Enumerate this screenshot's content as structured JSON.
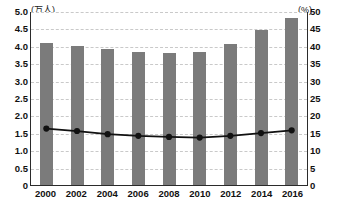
{
  "chart_data": {
    "type": "bar",
    "title": "",
    "subtitle": "",
    "xlabel": "",
    "ylabel": "(万人)",
    "y2label": "(%)",
    "grid": true,
    "legend": "none",
    "categories": [
      "2000",
      "2002",
      "2004",
      "2006",
      "2008",
      "2010",
      "2012",
      "2014",
      "2016"
    ],
    "ylim": [
      0,
      5.0
    ],
    "y2lim": [
      0,
      50
    ],
    "yticks": [
      "0",
      "0.5",
      "1.0",
      "1.5",
      "2.0",
      "2.5",
      "3.0",
      "3.5",
      "4.0",
      "4.5",
      "5.0"
    ],
    "ytick_values": [
      0,
      0.5,
      1.0,
      1.5,
      2.0,
      2.5,
      3.0,
      3.5,
      4.0,
      4.5,
      5.0
    ],
    "y2ticks": [
      "0",
      "5",
      "10",
      "15",
      "20",
      "25",
      "30",
      "35",
      "40",
      "45",
      "50"
    ],
    "y2tick_values": [
      0,
      5,
      10,
      15,
      20,
      25,
      30,
      35,
      40,
      45,
      50
    ],
    "series": [
      {
        "name": "人数",
        "type": "bar",
        "axis": "left",
        "unit": "万人",
        "color": "#7b7b7b",
        "values": [
          4.08,
          4.0,
          3.9,
          3.83,
          3.78,
          3.82,
          4.05,
          4.45,
          4.8
        ]
      },
      {
        "name": "割合",
        "type": "line",
        "axis": "right",
        "unit": "%",
        "color": "#111111",
        "values": [
          16.3,
          15.6,
          14.7,
          14.2,
          13.9,
          13.7,
          14.2,
          15.0,
          15.8
        ]
      }
    ]
  }
}
